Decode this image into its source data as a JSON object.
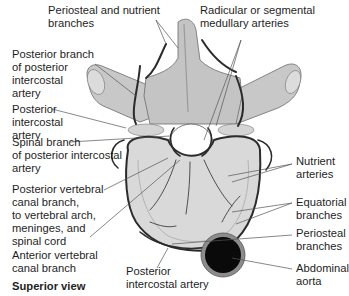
{
  "diagram": {
    "view_caption": "Superior view",
    "colors": {
      "bone": "#c9c9c9",
      "bone_shadow": "#9a9a9a",
      "artery": "#2b2b2b",
      "aorta_fill": "#0a0a0a",
      "aorta_ring": "#8c8c8c",
      "leader": "#555555"
    },
    "labels": {
      "periosteal_nutrient": "Periosteal and nutrient\nbranches",
      "radicular": "Radicular or segmental\nmedullary arteries",
      "posterior_branch": "Posterior branch\nof posterior\nintercostal\nartery",
      "posterior_intercostal_upper": "Posterior\nintercostal\nartery",
      "spinal_branch": "Spinal branch\nof posterior intercostal\nartery",
      "posterior_vertebral_canal": "Posterior vertebral\ncanal branch,\nto vertebral arch,\nmeninges, and\nspinal cord",
      "anterior_vertebral_canal": "Anterior vertebral\ncanal branch",
      "nutrient_arteries": "Nutrient\narteries",
      "equatorial": "Equatorial\nbranches",
      "periosteal": "Periosteal\nbranches",
      "abdominal_aorta": "Abdominal\naorta",
      "posterior_intercostal_lower": "Posterior\nintercostal artery"
    }
  }
}
